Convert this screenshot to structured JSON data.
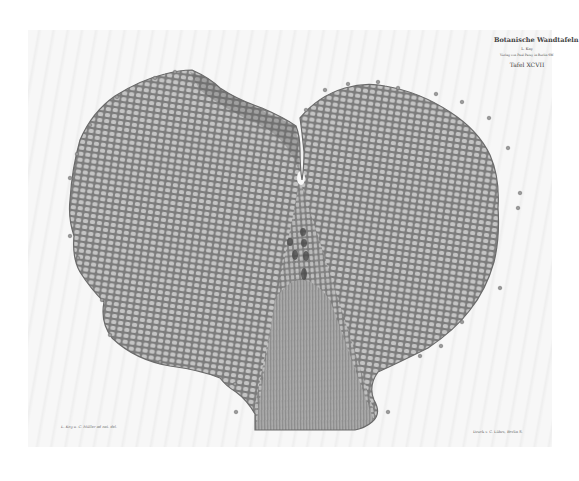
{
  "plate": {
    "series_title": "Botanische Wandtafeln",
    "volume": "L. Kny",
    "publisher_line": "Verlag von Paul Parey in Berlin SW.",
    "plate_number": "Tafel XCVII",
    "credit_left": "L. Kny u. C. Müller ad nat. del.",
    "credit_right": "Druck v. C. Lührs, Berlin S."
  },
  "illustration": {
    "subject": "heart-shaped cellular thallus (prothallium) with radiating cell network",
    "fill_color": "#9a9a9a",
    "cell_wall_color": "#6e6e6e",
    "cell_lumen_color": "#c8c8c8",
    "paper_color": "#f7f7f7"
  }
}
